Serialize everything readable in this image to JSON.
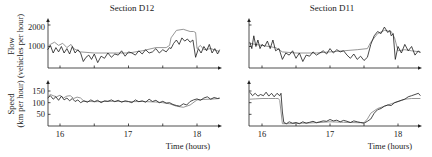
{
  "chart_data": [
    {
      "type": "line",
      "panel": "top-left",
      "title": "Section D12",
      "xlabel": "",
      "ylabel": "Flow (vehicles per hour)",
      "yticks": [
        1000,
        2000
      ],
      "ylim": [
        0,
        2200
      ],
      "xlim": [
        15.82,
        18.35
      ],
      "series": [
        {
          "name": "measured",
          "style": "dark",
          "x": [
            15.82,
            15.86,
            15.9,
            15.94,
            15.98,
            16.02,
            16.06,
            16.1,
            16.14,
            16.18,
            16.22,
            16.26,
            16.3,
            16.34,
            16.38,
            16.42,
            16.46,
            16.5,
            16.55,
            16.6,
            16.65,
            16.7,
            16.75,
            16.8,
            16.85,
            16.9,
            16.95,
            17.0,
            17.05,
            17.1,
            17.15,
            17.2,
            17.25,
            17.3,
            17.35,
            17.4,
            17.45,
            17.5,
            17.55,
            17.6,
            17.62,
            17.66,
            17.7,
            17.74,
            17.78,
            17.82,
            17.86,
            17.9,
            17.94,
            17.98,
            18.02,
            18.06,
            18.1,
            18.14,
            18.18,
            18.22,
            18.26,
            18.3,
            18.33
          ],
          "y": [
            850,
            1050,
            700,
            950,
            750,
            1000,
            700,
            900,
            650,
            1000,
            700,
            850,
            700,
            300,
            500,
            600,
            400,
            650,
            250,
            550,
            450,
            700,
            500,
            650,
            600,
            800,
            550,
            750,
            700,
            600,
            800,
            650,
            850,
            700,
            750,
            900,
            700,
            850,
            750,
            950,
            900,
            1150,
            1300,
            1100,
            1400,
            1250,
            1350,
            1200,
            1300,
            500,
            900,
            700,
            1000,
            800,
            1100,
            700,
            900,
            650,
            850
          ]
        },
        {
          "name": "model",
          "style": "gray",
          "x": [
            15.82,
            15.86,
            15.92,
            15.98,
            16.04,
            16.1,
            16.16,
            16.2,
            16.3,
            16.5,
            16.8,
            17.0,
            17.2,
            17.4,
            17.55,
            17.6,
            17.62,
            17.7,
            17.8,
            17.9,
            17.95,
            17.98,
            18.0,
            18.05,
            18.1,
            18.2,
            18.3,
            18.33
          ],
          "y": [
            1000,
            1100,
            1200,
            1050,
            1150,
            950,
            1100,
            900,
            750,
            700,
            700,
            700,
            800,
            950,
            950,
            1050,
            1400,
            1750,
            1800,
            1700,
            1700,
            1650,
            900,
            1050,
            850,
            900,
            800,
            750
          ]
        }
      ]
    },
    {
      "type": "line",
      "panel": "top-right",
      "title": "Section D11",
      "xlabel": "",
      "ylabel": "",
      "ylim": [
        0,
        2200
      ],
      "xlim": [
        15.82,
        18.35
      ],
      "series": [
        {
          "name": "measured",
          "style": "dark",
          "x": [
            15.82,
            15.85,
            15.88,
            15.91,
            15.94,
            15.97,
            16.0,
            16.04,
            16.08,
            16.12,
            16.16,
            16.2,
            16.25,
            16.3,
            16.35,
            16.4,
            16.45,
            16.5,
            16.55,
            16.6,
            16.65,
            16.7,
            16.75,
            16.8,
            16.85,
            16.9,
            16.95,
            17.0,
            17.05,
            17.1,
            17.15,
            17.2,
            17.25,
            17.3,
            17.35,
            17.4,
            17.45,
            17.5,
            17.55,
            17.6,
            17.65,
            17.7,
            17.75,
            17.8,
            17.85,
            17.88,
            17.9,
            17.93,
            17.96,
            18.0,
            18.05,
            18.1,
            18.15,
            18.2,
            18.25,
            18.3,
            18.33
          ],
          "y": [
            1200,
            900,
            1500,
            1000,
            1300,
            900,
            1100,
            1000,
            1250,
            900,
            1300,
            800,
            900,
            400,
            700,
            600,
            800,
            450,
            700,
            300,
            600,
            550,
            750,
            600,
            700,
            800,
            650,
            900,
            700,
            850,
            750,
            800,
            600,
            450,
            650,
            400,
            550,
            350,
            500,
            1100,
            1500,
            1700,
            1600,
            1900,
            1650,
            1750,
            1500,
            1600,
            400,
            1000,
            700,
            1100,
            800,
            1000,
            600,
            800,
            700
          ]
        },
        {
          "name": "model",
          "style": "gray",
          "x": [
            15.82,
            15.9,
            16.0,
            16.1,
            16.2,
            16.3,
            16.5,
            16.8,
            17.0,
            17.2,
            17.4,
            17.55,
            17.6,
            17.7,
            17.8,
            17.9,
            17.95,
            18.0,
            18.1,
            18.2,
            18.33
          ],
          "y": [
            1150,
            1100,
            1050,
            1000,
            950,
            750,
            700,
            700,
            750,
            800,
            850,
            900,
            1200,
            1600,
            1750,
            1700,
            1400,
            800,
            850,
            800,
            750
          ]
        }
      ]
    },
    {
      "type": "line",
      "panel": "bottom-left",
      "title": "",
      "xlabel": "Time (hours)",
      "ylabel": "Speed (km per hour)",
      "xticks": [
        16,
        17,
        18
      ],
      "yticks": [
        50,
        100,
        150
      ],
      "ylim": [
        0,
        180
      ],
      "xlim": [
        15.82,
        18.35
      ],
      "series": [
        {
          "name": "measured",
          "style": "dark",
          "x": [
            15.82,
            15.86,
            15.9,
            15.94,
            15.98,
            16.02,
            16.06,
            16.1,
            16.14,
            16.18,
            16.22,
            16.26,
            16.3,
            16.35,
            16.4,
            16.45,
            16.5,
            16.55,
            16.6,
            16.65,
            16.7,
            16.75,
            16.8,
            16.85,
            16.9,
            16.95,
            17.0,
            17.05,
            17.1,
            17.15,
            17.2,
            17.25,
            17.3,
            17.35,
            17.4,
            17.45,
            17.5,
            17.55,
            17.6,
            17.65,
            17.7,
            17.75,
            17.8,
            17.85,
            17.9,
            17.95,
            18.0,
            18.05,
            18.1,
            18.15,
            18.2,
            18.25,
            18.3,
            18.33
          ],
          "y": [
            120,
            130,
            115,
            125,
            110,
            128,
            112,
            120,
            108,
            118,
            105,
            112,
            100,
            108,
            102,
            112,
            104,
            110,
            100,
            108,
            106,
            112,
            104,
            110,
            102,
            108,
            105,
            100,
            112,
            104,
            108,
            102,
            115,
            105,
            110,
            100,
            106,
            98,
            100,
            92,
            88,
            85,
            95,
            90,
            105,
            112,
            116,
            110,
            120,
            125,
            115,
            122,
            118,
            120
          ]
        },
        {
          "name": "model",
          "style": "gray",
          "x": [
            15.82,
            15.86,
            15.9,
            15.95,
            16.0,
            16.05,
            16.1,
            16.15,
            16.2,
            16.25,
            16.3,
            16.35,
            16.5,
            16.8,
            17.0,
            17.2,
            17.4,
            17.5,
            17.6,
            17.7,
            17.8,
            17.9,
            18.0,
            18.1,
            18.2,
            18.33
          ],
          "y": [
            125,
            135,
            130,
            125,
            132,
            120,
            128,
            130,
            118,
            124,
            120,
            106,
            104,
            106,
            104,
            105,
            103,
            100,
            95,
            85,
            80,
            90,
            112,
            114,
            115,
            118
          ]
        }
      ]
    },
    {
      "type": "line",
      "panel": "bottom-right",
      "title": "",
      "xlabel": "Time (hours)",
      "ylabel": "",
      "xticks": [
        16,
        17,
        18
      ],
      "ylim": [
        0,
        180
      ],
      "xlim": [
        15.82,
        18.35
      ],
      "series": [
        {
          "name": "measured",
          "style": "dark",
          "x": [
            15.82,
            15.86,
            15.9,
            15.94,
            15.98,
            16.02,
            16.06,
            16.1,
            16.14,
            16.18,
            16.22,
            16.26,
            16.28,
            16.3,
            16.32,
            16.36,
            16.4,
            16.45,
            16.5,
            16.55,
            16.6,
            16.65,
            16.7,
            16.75,
            16.8,
            16.85,
            16.9,
            16.95,
            17.0,
            17.05,
            17.1,
            17.15,
            17.2,
            17.25,
            17.3,
            17.35,
            17.4,
            17.45,
            17.5,
            17.55,
            17.6,
            17.65,
            17.7,
            17.75,
            17.8,
            17.85,
            17.9,
            17.95,
            18.0,
            18.05,
            18.1,
            18.15,
            18.2,
            18.25,
            18.3,
            18.33
          ],
          "y": [
            145,
            130,
            140,
            128,
            135,
            130,
            145,
            128,
            140,
            125,
            140,
            130,
            140,
            60,
            15,
            10,
            18,
            12,
            15,
            10,
            18,
            12,
            16,
            20,
            14,
            18,
            22,
            20,
            28,
            22,
            25,
            18,
            24,
            20,
            15,
            22,
            18,
            15,
            12,
            20,
            30,
            55,
            70,
            75,
            85,
            90,
            88,
            100,
            105,
            110,
            115,
            125,
            130,
            135,
            140,
            130
          ]
        },
        {
          "name": "model",
          "style": "gray",
          "x": [
            15.82,
            15.9,
            16.0,
            16.1,
            16.2,
            16.24,
            16.26,
            16.3,
            16.4,
            16.6,
            16.8,
            17.0,
            17.2,
            17.4,
            17.5,
            17.55,
            17.6,
            17.7,
            17.8,
            17.9,
            18.0,
            18.1,
            18.2,
            18.33
          ],
          "y": [
            115,
            116,
            118,
            118,
            118,
            118,
            110,
            10,
            10,
            12,
            14,
            18,
            16,
            14,
            14,
            30,
            55,
            75,
            85,
            95,
            105,
            115,
            118,
            118
          ]
        }
      ]
    }
  ],
  "labels": {
    "title_left": "Section D12",
    "title_right": "Section D11",
    "flow_ylabel_line1": "Flow",
    "flow_ylabel_line2": "(vehicles per hour)",
    "speed_ylabel_line1": "Speed",
    "speed_ylabel_line2": "(km per hour)",
    "xlabel": "Time (hours)",
    "flow_tick_1000": "1000",
    "flow_tick_2000": "2000",
    "speed_tick_50": "50",
    "speed_tick_100": "100",
    "speed_tick_150": "150",
    "xtick_16": "16",
    "xtick_17": "17",
    "xtick_18": "18"
  }
}
